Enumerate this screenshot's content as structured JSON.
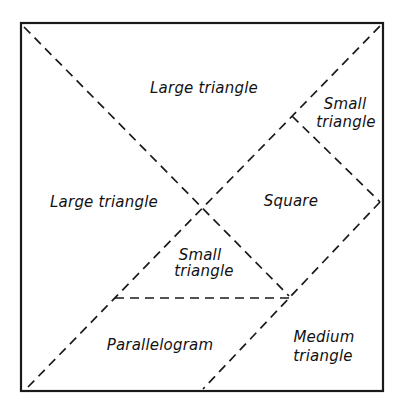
{
  "diagram": {
    "type": "tangram-square-dissection",
    "frame": {
      "x1": 21,
      "y1": 23,
      "x2": 383,
      "y2": 391
    },
    "line_color": "#1a1a1a",
    "background": "#ffffff",
    "cut_lines": [
      {
        "id": "diag-tl-center",
        "x1": 24,
        "y1": 27,
        "x2": 289,
        "y2": 296
      },
      {
        "id": "diag-bl-tr",
        "x1": 28,
        "y1": 387,
        "x2": 380,
        "y2": 26
      },
      {
        "id": "small-tri-to-right-edge",
        "x1": 292,
        "y1": 116,
        "x2": 380,
        "y2": 202
      },
      {
        "id": "right-edge-to-bottom",
        "x1": 380,
        "y1": 202,
        "x2": 203,
        "y2": 389
      },
      {
        "id": "horizontal",
        "x1": 115,
        "y1": 298,
        "x2": 289,
        "y2": 298
      }
    ],
    "pieces": [
      {
        "id": "large-triangle-top",
        "lines": [
          "Large triangle"
        ]
      },
      {
        "id": "large-triangle-left",
        "lines": [
          "Large triangle"
        ]
      },
      {
        "id": "small-triangle-top-right",
        "lines": [
          "Small",
          "triangle"
        ]
      },
      {
        "id": "square",
        "lines": [
          "Square"
        ]
      },
      {
        "id": "small-triangle-middle",
        "lines": [
          "Small",
          "triangle"
        ]
      },
      {
        "id": "parallelogram",
        "lines": [
          "Parallelogram"
        ]
      },
      {
        "id": "medium-triangle",
        "lines": [
          "Medium",
          "triangle"
        ]
      }
    ]
  }
}
